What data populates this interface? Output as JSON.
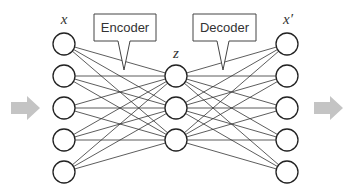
{
  "diagram": {
    "type": "autoencoder",
    "colors": {
      "node_stroke": "#222222",
      "edge": "#333333",
      "arrow": "#c4c4c4",
      "callout_stroke": "#444444",
      "text": "#333333"
    },
    "labels": {
      "input": "x",
      "latent": "z",
      "output": "x′"
    },
    "callouts": {
      "encoder": "Encoder",
      "decoder": "Decoder"
    },
    "layers": [
      {
        "name": "input",
        "x": 64,
        "nodes": [
          44,
          76,
          108,
          140,
          172
        ]
      },
      {
        "name": "latent",
        "x": 176,
        "nodes": [
          76,
          108,
          140
        ]
      },
      {
        "name": "output",
        "x": 287,
        "nodes": [
          44,
          76,
          108,
          140,
          172
        ]
      }
    ],
    "node_radius": 11,
    "arrows": {
      "left": {
        "x": 11,
        "y": 108
      },
      "right": {
        "x": 314,
        "y": 108
      }
    }
  }
}
